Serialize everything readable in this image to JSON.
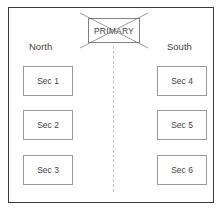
{
  "diagram": {
    "frame": {
      "name": "outer-frame",
      "border_color": "#3a3a3a"
    },
    "primary_node": {
      "label": "PRIMARY",
      "state": "crossed-out",
      "cross_color": "#6e6e6e",
      "border_color": "#808080"
    },
    "divider": {
      "style": "dashed-vertical",
      "color": "#c2c2c2"
    },
    "regions": [
      {
        "name": "north",
        "label": "North",
        "sections": [
          {
            "label": "Sec 1"
          },
          {
            "label": "Sec 2"
          },
          {
            "label": "Sec 3"
          }
        ]
      },
      {
        "name": "south",
        "label": "South",
        "sections": [
          {
            "label": "Sec 4"
          },
          {
            "label": "Sec 5"
          },
          {
            "label": "Sec 6"
          }
        ]
      }
    ]
  }
}
